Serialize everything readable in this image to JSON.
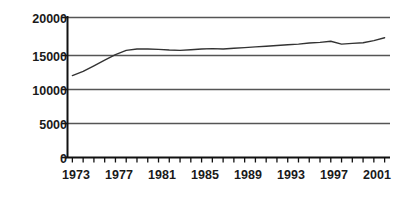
{
  "chart_data": {
    "type": "line",
    "title": "",
    "subtitle": "",
    "xlabel": "",
    "ylabel": "",
    "grid": true,
    "gridlines_horizontal": [
      0,
      5000,
      10000,
      15000,
      20000
    ],
    "legend": null,
    "legend_position": "none",
    "line_color": "#333333",
    "axis_color": "#000000",
    "gridline_color": "#555555",
    "background_color": "#ffffff",
    "xlim": [
      1972.5,
      2002.5
    ],
    "ylim": [
      0,
      20000
    ],
    "y_ticks": [
      0,
      5000,
      10000,
      15000,
      20000
    ],
    "y_tick_labels": [
      "0",
      "5000",
      "10000",
      "15000",
      "20000"
    ],
    "x_ticks": [
      1973,
      1974,
      1975,
      1976,
      1977,
      1978,
      1979,
      1980,
      1981,
      1982,
      1983,
      1984,
      1985,
      1986,
      1987,
      1988,
      1989,
      1990,
      1991,
      1992,
      1993,
      1994,
      1995,
      1996,
      1997,
      1998,
      1999,
      2000,
      2001,
      2002
    ],
    "x_tick_labels_shown": [
      "1973",
      "1977",
      "1981",
      "1985",
      "1989",
      "1993",
      "1997",
      "2001"
    ],
    "x_tick_label_values": [
      1973,
      1977,
      1981,
      1985,
      1989,
      1993,
      1997,
      2001
    ],
    "x": [
      1973,
      1974,
      1975,
      1976,
      1977,
      1978,
      1979,
      1980,
      1981,
      1982,
      1983,
      1984,
      1985,
      1986,
      1987,
      1988,
      1989,
      1990,
      1991,
      1992,
      1993,
      1994,
      1995,
      1996,
      1997,
      1998,
      1999,
      2000,
      2001,
      2002
    ],
    "values": [
      11700,
      12300,
      13100,
      13900,
      14700,
      15300,
      15500,
      15500,
      15450,
      15350,
      15300,
      15400,
      15500,
      15550,
      15500,
      15600,
      15700,
      15800,
      15900,
      16000,
      16100,
      16200,
      16350,
      16450,
      16600,
      16200,
      16300,
      16400,
      16700,
      17100
    ],
    "series": [
      {
        "name": "series-1",
        "values": [
          11700,
          12300,
          13100,
          13900,
          14700,
          15300,
          15500,
          15500,
          15450,
          15350,
          15300,
          15400,
          15500,
          15550,
          15500,
          15600,
          15700,
          15800,
          15900,
          16000,
          16100,
          16200,
          16350,
          16450,
          16600,
          16200,
          16300,
          16400,
          16700,
          17100
        ]
      }
    ]
  },
  "ytick_labels": {
    "t0": "20000",
    "t1": "15000",
    "t2": "10000",
    "t3": "5000",
    "t4": "0"
  },
  "xtick_labels": {
    "t0": "1973",
    "t1": "1977",
    "t2": "1981",
    "t3": "1985",
    "t4": "1989",
    "t5": "1993",
    "t6": "1997",
    "t7": "2001"
  }
}
